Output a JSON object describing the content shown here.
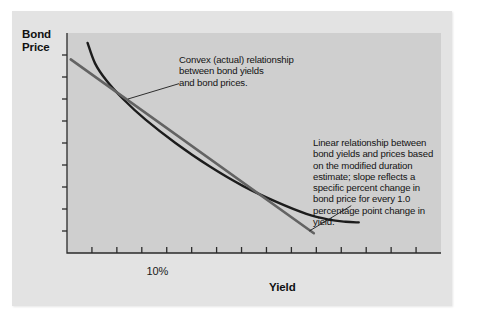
{
  "figure": {
    "background_color": "#ffffff",
    "card_color": "#e3e3e3",
    "plot_color": "#cfcfcf"
  },
  "chart_data": {
    "type": "line",
    "title": "",
    "xlabel": "Yield",
    "ylabel": "Bond Price",
    "grid": false,
    "legend": "none",
    "x_tick_labels": [
      "10%"
    ],
    "x_tick_label_positions": [
      0.25
    ],
    "x_tick_count": 14,
    "y_tick_count": 9,
    "xlim": [
      0,
      1
    ],
    "ylim": [
      0,
      1
    ],
    "series": [
      {
        "name": "Convex (actual) relationship",
        "style": "curve",
        "color": "#1c1c1c",
        "width": 2.4,
        "points": [
          [
            0.055,
            0.955
          ],
          [
            0.075,
            0.862
          ],
          [
            0.105,
            0.785
          ],
          [
            0.15,
            0.7
          ],
          [
            0.21,
            0.606
          ],
          [
            0.29,
            0.5
          ],
          [
            0.38,
            0.395
          ],
          [
            0.47,
            0.305
          ],
          [
            0.56,
            0.232
          ],
          [
            0.64,
            0.178
          ],
          [
            0.7,
            0.152
          ],
          [
            0.745,
            0.142
          ],
          [
            0.78,
            0.139
          ]
        ]
      },
      {
        "name": "Linear relationship (modified duration estimate)",
        "style": "line",
        "color": "#636363",
        "width": 2.6,
        "points": [
          [
            0.01,
            0.88
          ],
          [
            0.66,
            0.09
          ]
        ]
      }
    ],
    "annotations": [
      {
        "id": "convex",
        "text": "Convex (actual) relationship\nbetween bond yields\nand bond prices.",
        "leader_from": [
          0.163,
          0.7
        ],
        "leader_to": [
          0.3,
          0.77
        ]
      },
      {
        "id": "linear",
        "text": "Linear relationship between\nbond yields and prices based\non the modified duration\nestimate; slope reflects a\nspecific percent change in\nbond price for every 1.0\npercentage point change in\nyield.",
        "leader_from": [
          0.648,
          0.1
        ],
        "leader_to": [
          0.76,
          0.215
        ]
      }
    ]
  },
  "axis_titles": {
    "y": "Bond\nPrice",
    "x": "Yield"
  },
  "tick_labels": {
    "x_10_percent": "10%"
  },
  "annotations": {
    "convex": "Convex (actual) relationship\nbetween bond yields\nand bond prices.",
    "linear": "Linear relationship between\nbond yields and prices based\non the modified duration\nestimate; slope reflects a\nspecific percent change in\nbond price for every 1.0\npercentage point change in\nyield."
  }
}
